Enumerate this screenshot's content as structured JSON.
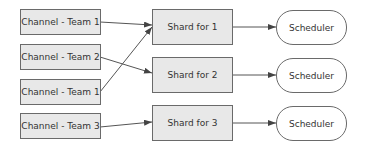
{
  "diagram": {
    "channels": [
      {
        "label": "Channel - Team 1"
      },
      {
        "label": "Channel - Team 2"
      },
      {
        "label": "Channel - Team 1"
      },
      {
        "label": "Channel - Team 3"
      }
    ],
    "shards": [
      {
        "label": "Shard for 1"
      },
      {
        "label": "Shard for 2"
      },
      {
        "label": "Shard for 3"
      }
    ],
    "schedulers": [
      {
        "label": "Scheduler"
      },
      {
        "label": "Scheduler"
      },
      {
        "label": "Scheduler"
      }
    ],
    "edges": [
      {
        "from": "channel-0",
        "to": "shard-0"
      },
      {
        "from": "channel-1",
        "to": "shard-1"
      },
      {
        "from": "channel-2",
        "to": "shard-0"
      },
      {
        "from": "channel-3",
        "to": "shard-2"
      },
      {
        "from": "shard-0",
        "to": "scheduler-0"
      },
      {
        "from": "shard-1",
        "to": "scheduler-1"
      },
      {
        "from": "shard-2",
        "to": "scheduler-2"
      }
    ],
    "colors": {
      "node_fill": "#e8e8e8",
      "node_border": "#6a6a6a",
      "edge": "#444444"
    }
  }
}
